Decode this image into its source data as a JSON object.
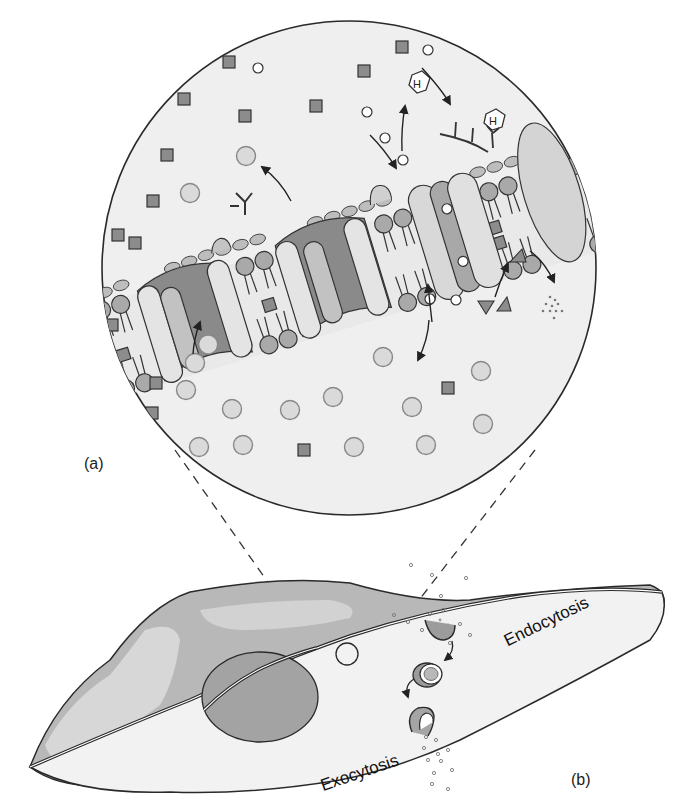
{
  "figure": {
    "panel_a_label": "(a)",
    "panel_b_label": "(b)",
    "endocytosis_label": "Endocytosis",
    "exocytosis_label": "Exocytosis",
    "hormone_glyph": "H"
  },
  "colors": {
    "background": "#ffffff",
    "zoom_circle_fill": "#efefef",
    "outline": "#2a2a2a",
    "phospholipid_head": "#a9a9a9",
    "protein_light": "#e4e4e4",
    "protein_mid": "#c2c2c2",
    "protein_dark": "#8a8a8a",
    "square_solute": "#8c8c8c",
    "open_circle_solute": "#ffffff",
    "large_circle_solute": "#dadada",
    "cell_dark": "#b8b8b8",
    "cell_light": "#e6e6e6",
    "nucleus": "#a3a3a3"
  },
  "icons": {
    "hormone": "hexagon-H-icon",
    "receptor": "branched-Y-icon",
    "arrow": "curved-arrow-icon"
  }
}
